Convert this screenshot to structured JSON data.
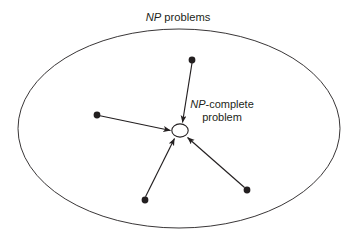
{
  "figure": {
    "name": "np-complete-problem-diagram",
    "type": "diagram",
    "background_color": "#ffffff",
    "stroke_color": "#231f20",
    "text_color": "#231f20"
  },
  "labels": {
    "title_italic": "NP",
    "title_rest": " problems",
    "node_label_line1_italic": "NP",
    "node_label_line1_rest": "-complete",
    "node_label_line2": "problem"
  },
  "outer_region": {
    "name": "np-problems-ellipse",
    "cx": 179,
    "cy": 128.5,
    "rx": 161,
    "ry": 99.5,
    "stroke": "#231f20",
    "stroke_width": 0.9,
    "fill": "none"
  },
  "center_node": {
    "name": "np-complete-node",
    "cx": 180,
    "cy": 130.5,
    "rx": 8.2,
    "ry": 6.6,
    "stroke": "#231f20",
    "stroke_width": 1.1,
    "fill": "#ffffff"
  },
  "source_nodes": [
    {
      "name": "problem-node-top",
      "cx": 192,
      "cy": 60,
      "r": 3.4
    },
    {
      "name": "problem-node-left",
      "cx": 97,
      "cy": 115,
      "r": 3.4
    },
    {
      "name": "problem-node-bottom-left",
      "cx": 145,
      "cy": 200,
      "r": 3.4
    },
    {
      "name": "problem-node-bottom-right",
      "cx": 247,
      "cy": 190,
      "r": 3.4
    }
  ],
  "reduction_arrows": [
    {
      "name": "reduction-arrow-from-top",
      "x1": 192,
      "y1": 63,
      "x2": 182.5,
      "y2": 122.5
    },
    {
      "name": "reduction-arrow-from-left",
      "x1": 100,
      "y1": 115.8,
      "x2": 170.5,
      "y2": 130.5
    },
    {
      "name": "reduction-arrow-from-bottom-left",
      "x1": 145.5,
      "y1": 196.8,
      "x2": 174.5,
      "y2": 138.5
    },
    {
      "name": "reduction-arrow-from-bottom-right",
      "x1": 244.5,
      "y1": 187.5,
      "x2": 187.5,
      "y2": 137.5
    }
  ],
  "text_positions": {
    "title_x": 178,
    "title_y": 21,
    "node_label_line1_x": 222,
    "node_label_line1_y": 108,
    "node_label_line2_x": 222,
    "node_label_line2_y": 121
  }
}
